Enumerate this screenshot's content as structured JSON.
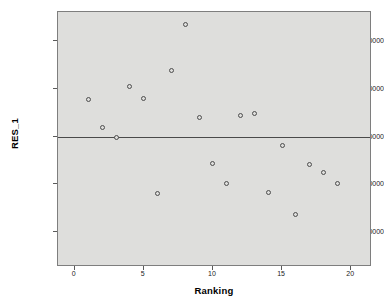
{
  "chart_data": {
    "type": "scatter",
    "title": "",
    "xlabel": "Ranking",
    "ylabel": "RES_1",
    "xlim": [
      -1.2,
      21.5
    ],
    "ylim": [
      -68.5,
      65.5
    ],
    "grid": false,
    "legend": null,
    "reference_lines": [
      {
        "axis": "y",
        "value": 0
      }
    ],
    "x_tick_labels": [
      "0",
      "5",
      "10",
      "15",
      "20"
    ],
    "x_ticks": [
      0,
      5,
      10,
      15,
      20
    ],
    "y_tick_labels": [
      "50.00000",
      "25.00000",
      "0.00000",
      "-25.00000",
      "-50.00000"
    ],
    "y_ticks": [
      50,
      25,
      0,
      -25,
      -50
    ],
    "x": [
      1,
      2,
      3,
      4,
      5,
      6,
      7,
      8,
      9,
      10,
      11,
      12,
      13,
      14,
      15,
      16,
      17,
      18,
      19
    ],
    "values": [
      19.5,
      5.0,
      -0.5,
      26.5,
      20.0,
      -30.0,
      35.0,
      59.0,
      10.0,
      -14.0,
      -24.5,
      11.0,
      12.0,
      -29.5,
      -4.5,
      -41.0,
      -14.5,
      -19.0,
      -24.5
    ],
    "points": [
      {
        "x": 1,
        "y": 19.5
      },
      {
        "x": 2,
        "y": 5.0
      },
      {
        "x": 3,
        "y": -0.5
      },
      {
        "x": 4,
        "y": 26.5
      },
      {
        "x": 5,
        "y": 20.0
      },
      {
        "x": 6,
        "y": -30.0
      },
      {
        "x": 7,
        "y": 35.0
      },
      {
        "x": 8,
        "y": 59.0
      },
      {
        "x": 9,
        "y": 10.0
      },
      {
        "x": 10,
        "y": -14.0
      },
      {
        "x": 11,
        "y": -24.5
      },
      {
        "x": 12,
        "y": 11.0
      },
      {
        "x": 13,
        "y": 12.0
      },
      {
        "x": 14,
        "y": -29.5
      },
      {
        "x": 15,
        "y": -4.5
      },
      {
        "x": 16,
        "y": -41.0
      },
      {
        "x": 17,
        "y": -14.5
      },
      {
        "x": 18,
        "y": -19.0
      },
      {
        "x": 19,
        "y": -24.5
      }
    ],
    "colors": {
      "plot_background": "#dededc",
      "page_background": "#ffffff",
      "marker_stroke": "#4d4d4d",
      "axis_line": "#7e7e7e",
      "reference_line": "#4a4a4a",
      "text": "#1a1a1a"
    }
  }
}
